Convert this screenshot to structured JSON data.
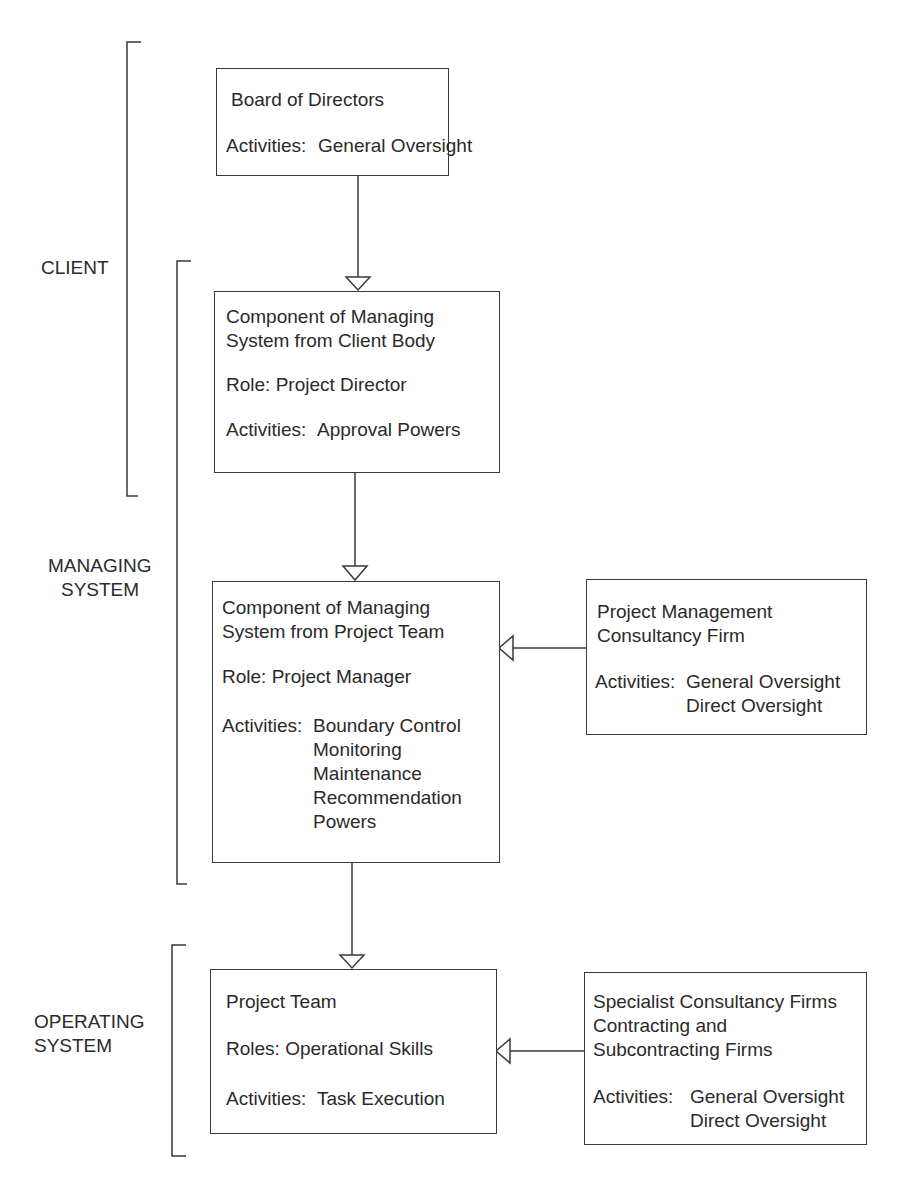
{
  "groups": {
    "client": {
      "label": "CLIENT"
    },
    "managing": {
      "line1": "MANAGING",
      "line2": "SYSTEM"
    },
    "operating": {
      "line1": "OPERATING",
      "line2": "SYSTEM"
    }
  },
  "boxes": {
    "board": {
      "title": "Board of Directors",
      "activities_label": "Activities:",
      "activities": [
        "General Oversight"
      ]
    },
    "client_component": {
      "title_line1": "Component of Managing",
      "title_line2": "System from Client Body",
      "role": "Role: Project Director",
      "activities_label": "Activities:",
      "activities": [
        "Approval Powers"
      ]
    },
    "team_component": {
      "title_line1": "Component of Managing",
      "title_line2": "System from Project Team",
      "role": "Role: Project Manager",
      "activities_label": "Activities:",
      "activities": [
        "Boundary Control",
        "Monitoring",
        "Maintenance",
        "Recommendation",
        "Powers"
      ]
    },
    "pm_firm": {
      "title_line1": "Project Management",
      "title_line2": "Consultancy Firm",
      "activities_label": "Activities:",
      "activities": [
        "General Oversight",
        "Direct Oversight"
      ]
    },
    "project_team": {
      "title": "Project Team",
      "role": "Roles: Operational Skills",
      "activities_label": "Activities:",
      "activities": [
        "Task Execution"
      ]
    },
    "specialist_firms": {
      "title_line1": "Specialist Consultancy Firms",
      "title_line2": "Contracting and",
      "title_line3": "Subcontracting Firms",
      "activities_label": "Activities:",
      "activities": [
        "General Oversight",
        "Direct Oversight"
      ]
    }
  }
}
